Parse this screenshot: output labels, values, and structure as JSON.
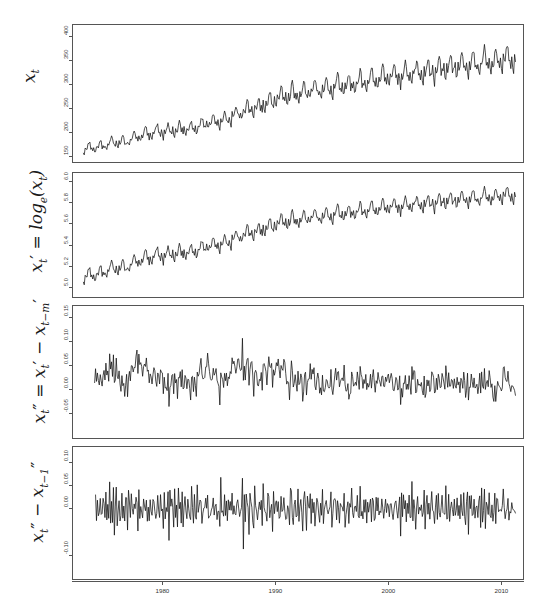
{
  "figure": {
    "title": "",
    "background": "#ffffff",
    "line_color": "#111111",
    "frame_color": "#555555",
    "width": 555,
    "height": 614
  },
  "axes": {
    "x_ticks": [
      "1980",
      "1990",
      "2000",
      "2010"
    ],
    "x_tick_values": [
      1980,
      1990,
      2000,
      2010
    ],
    "x_range": [
      1972.0,
      2012.0
    ]
  },
  "panels": [
    {
      "name": "level-series",
      "ylabel_plain": "x_t",
      "y_ticks": [
        "150",
        "200",
        "250",
        "300",
        "350",
        "400"
      ],
      "y_tick_values": [
        150,
        200,
        250,
        300,
        350,
        400
      ],
      "ylim": [
        135,
        425
      ]
    },
    {
      "name": "log-series",
      "ylabel_plain": "x'_t = log_e(x_t)",
      "y_ticks": [
        "5.0",
        "5.2",
        "5.4",
        "5.6",
        "5.8",
        "6.0"
      ],
      "y_tick_values": [
        5.0,
        5.2,
        5.4,
        5.6,
        5.8,
        6.0
      ],
      "ylim": [
        4.9,
        6.08
      ]
    },
    {
      "name": "seasonal-difference-series",
      "ylabel_plain": "x''_t = x'_t - x'_{t-m}",
      "y_ticks": [
        "-0.05",
        "0.00",
        "0.05",
        "0.10",
        "0.15"
      ],
      "y_tick_values": [
        -0.05,
        0.0,
        0.05,
        0.1,
        0.15
      ],
      "ylim": [
        -0.105,
        0.175
      ]
    },
    {
      "name": "first-difference-series",
      "ylabel_plain": "x''_t - x''_{t-1}",
      "y_ticks": [
        "-0.10",
        "0.00",
        "0.05",
        "0.10"
      ],
      "y_tick_values": [
        -0.1,
        0.0,
        0.05,
        0.1
      ],
      "ylim": [
        -0.155,
        0.135
      ]
    }
  ],
  "chart_data": {
    "type": "line",
    "title": "",
    "xlabel": "",
    "ylabel": "",
    "n_panels": 4,
    "x_start": 1973.0,
    "x_end": 2011.33,
    "x_step_years": 0.0833333,
    "n_points": 460,
    "series": [
      {
        "name": "x_t",
        "panel": 0,
        "ylabel": "x_t",
        "ylim": [
          135,
          425
        ],
        "yticks": [
          150,
          200,
          250,
          300,
          350,
          400
        ],
        "model": {
          "kind": "trend_plus_seasonal",
          "trend_knots_x": [
            1973.0,
            1976.0,
            1979.0,
            1982.0,
            1985.0,
            1988.0,
            1991.0,
            1994.0,
            1997.0,
            2000.0,
            2003.0,
            2006.0,
            2009.0,
            2011.3
          ],
          "trend_knots_y": [
            163,
            177,
            196,
            205,
            222,
            248,
            275,
            288,
            300,
            315,
            322,
            336,
            344,
            352
          ],
          "seasonal_amp_knots_x": [
            1973.0,
            1985.0,
            1995.0,
            2011.3
          ],
          "seasonal_amp_knots_y": [
            13,
            18,
            26,
            32
          ],
          "seasonal_shape": [
            -0.52,
            -0.78,
            0.22,
            -0.12,
            0.04,
            0.62,
            1.0,
            0.74,
            -0.18,
            -0.02,
            -0.46,
            0.2
          ],
          "noise_sd_frac": 0.022
        }
      },
      {
        "name": "x'_t = log_e(x_t)",
        "panel": 1,
        "ylabel": "x'_t = log_e(x_t)",
        "ylim": [
          4.9,
          6.08
        ],
        "yticks": [
          5.0,
          5.2,
          5.4,
          5.6,
          5.8,
          6.0
        ],
        "derived_from": "x_t",
        "transform": "log"
      },
      {
        "name": "x''_t = x'_t - x'_{t-m}",
        "panel": 2,
        "ylabel": "x''_t = x'_t - x'_{t-m}",
        "ylim": [
          -0.105,
          0.175
        ],
        "yticks": [
          -0.05,
          0.0,
          0.05,
          0.1,
          0.15
        ],
        "derived_from": "x'_t",
        "transform": "seasonal_difference",
        "lag": 12,
        "notable": {
          "mean": 0.017,
          "min": -0.095,
          "max": 0.157,
          "max_x": 1990.3,
          "min_x": 1981.9
        }
      },
      {
        "name": "x''_t - x''_{t-1}",
        "panel": 3,
        "ylabel": "x''_t - x''_{t-1}",
        "ylim": [
          -0.155,
          0.135
        ],
        "yticks": [
          -0.1,
          0.0,
          0.05,
          0.1
        ],
        "derived_from": "x''_t",
        "transform": "first_difference",
        "lag": 1,
        "notable": {
          "mean": 0.0,
          "min": -0.147,
          "max": 0.126,
          "max_x": 1991.1,
          "min_x": 1985.9
        }
      }
    ],
    "grid": false,
    "legend": "none"
  }
}
